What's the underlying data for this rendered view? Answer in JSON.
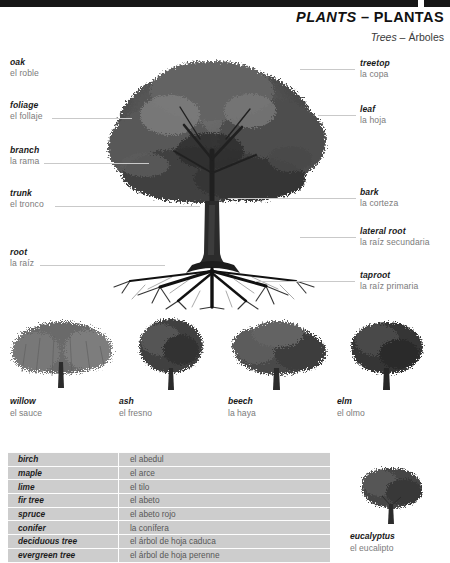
{
  "header": {
    "title_en": "PLANTS",
    "title_dash": " – ",
    "title_es": "PLANTAS",
    "subtitle_en": "Trees",
    "subtitle_dash": " – ",
    "subtitle_es": "Árboles"
  },
  "diagram": {
    "left_labels": [
      {
        "en": "oak",
        "es": "el roble"
      },
      {
        "en": "foliage",
        "es": "el follaje"
      },
      {
        "en": "branch",
        "es": "la rama"
      },
      {
        "en": "trunk",
        "es": "el tronco"
      },
      {
        "en": "root",
        "es": "la raíz"
      }
    ],
    "right_labels": [
      {
        "en": "treetop",
        "es": "la copa"
      },
      {
        "en": "leaf",
        "es": "la hoja"
      },
      {
        "en": "bark",
        "es": "la corteza"
      },
      {
        "en": "lateral root",
        "es": "la raíz secundaria"
      },
      {
        "en": "taproot",
        "es": "la raíz primaria"
      }
    ]
  },
  "specimens": [
    {
      "en": "willow",
      "es": "el sauce"
    },
    {
      "en": "ash",
      "es": "el fresno"
    },
    {
      "en": "beech",
      "es": "la haya"
    },
    {
      "en": "elm",
      "es": "el olmo"
    }
  ],
  "vocabulary": [
    {
      "en": "birch",
      "es": "el abedul"
    },
    {
      "en": "maple",
      "es": "el arce"
    },
    {
      "en": "lime",
      "es": "el tilo"
    },
    {
      "en": "fir tree",
      "es": "el abeto"
    },
    {
      "en": "spruce",
      "es": "el abeto rojo"
    },
    {
      "en": "conifer",
      "es": "la conífera"
    },
    {
      "en": "deciduous tree",
      "es": "el árbol de hoja caduca"
    },
    {
      "en": "evergreen tree",
      "es": "el árbol de hoja perenne"
    }
  ],
  "eucalyptus": {
    "en": "eucalyptus",
    "es": "el eucalipto"
  },
  "colors": {
    "topbar": "#161616",
    "table_bg": "#cdcdcd",
    "leader_line": "#c9c9c9",
    "english_text": "#1a1a1a",
    "spanish_text": "#7b7b7b"
  }
}
